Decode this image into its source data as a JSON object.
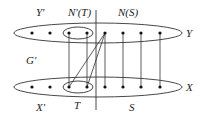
{
  "diagram": {
    "type": "bipartite-graph",
    "labels": {
      "y_prime": "Y'",
      "n_prime_t": "N'(T)",
      "n_s": "N(S)",
      "y": "Y",
      "g_prime": "G'",
      "x": "X",
      "x_prime": "X'",
      "t": "T",
      "s": "S"
    },
    "partitions": {
      "Y": [
        "y1",
        "y2",
        "y3",
        "y4",
        "y5",
        "y6",
        "y7",
        "y8"
      ],
      "X": [
        "x1",
        "x2",
        "x3",
        "x4",
        "x5",
        "x6",
        "x7",
        "x8"
      ]
    },
    "subsets": {
      "N'(T)": [
        "y3",
        "y4"
      ],
      "T": [
        "x3",
        "x4"
      ]
    },
    "edges": [
      [
        "y3",
        "x3"
      ],
      [
        "y4",
        "x4"
      ],
      [
        "y5",
        "x3"
      ],
      [
        "y5",
        "x4"
      ],
      [
        "y5",
        "x5"
      ],
      [
        "y6",
        "x6"
      ],
      [
        "y7",
        "x7"
      ],
      [
        "y8",
        "x8"
      ]
    ]
  }
}
